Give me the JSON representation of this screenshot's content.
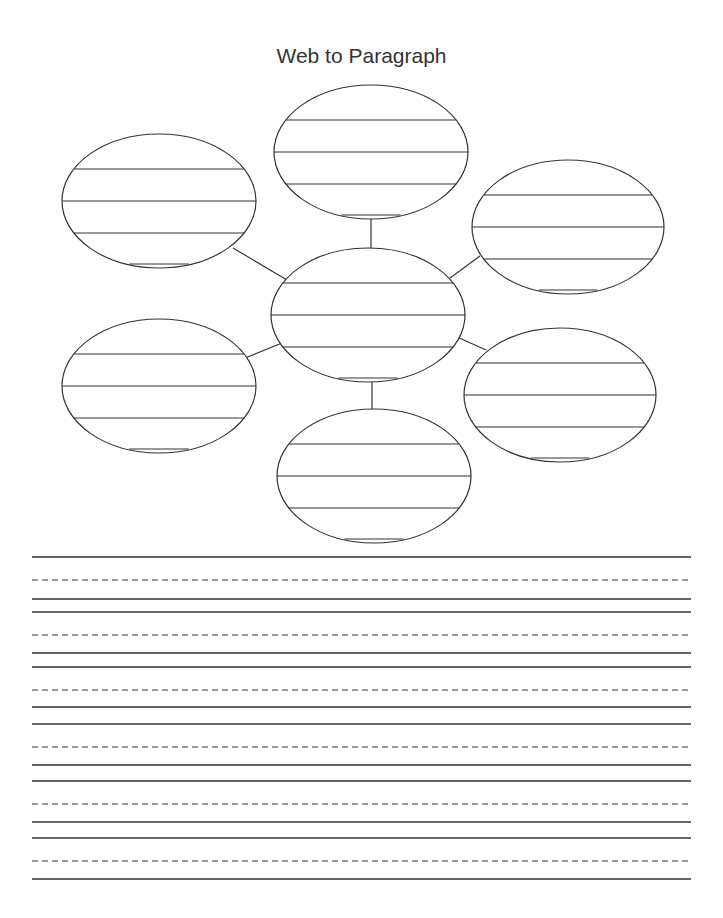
{
  "title": "Web to Paragraph",
  "colors": {
    "ink": "#333333",
    "paper": "#ffffff"
  },
  "web": {
    "center_node": {
      "cx": 368,
      "cy": 315,
      "rx": 97,
      "ry": 67,
      "blank_lines": 4
    },
    "outer_nodes": [
      {
        "position": "top",
        "cx": 371,
        "cy": 152,
        "rx": 97,
        "ry": 67,
        "blank_lines": 4
      },
      {
        "position": "upper-left",
        "cx": 159,
        "cy": 201,
        "rx": 97,
        "ry": 67,
        "blank_lines": 4
      },
      {
        "position": "upper-right",
        "cx": 568,
        "cy": 227,
        "rx": 96,
        "ry": 67,
        "blank_lines": 4
      },
      {
        "position": "lower-left",
        "cx": 159,
        "cy": 386,
        "rx": 97,
        "ry": 67,
        "blank_lines": 4
      },
      {
        "position": "lower-right",
        "cx": 560,
        "cy": 395,
        "rx": 96,
        "ry": 67,
        "blank_lines": 4
      },
      {
        "position": "bottom",
        "cx": 374,
        "cy": 476,
        "rx": 97,
        "ry": 67,
        "blank_lines": 4
      }
    ]
  },
  "writing_area": {
    "line_groups": [
      {
        "top": 557,
        "dashed": 580,
        "base": 599
      },
      {
        "top": 612,
        "dashed": 635,
        "base": 653
      },
      {
        "top": 667,
        "dashed": 690,
        "base": 707
      },
      {
        "top": 724,
        "dashed": 747,
        "base": 765
      },
      {
        "top": 781,
        "dashed": 804,
        "base": 822
      },
      {
        "top": 838,
        "dashed": 861,
        "base": 879
      }
    ],
    "left": 32,
    "right": 691
  }
}
